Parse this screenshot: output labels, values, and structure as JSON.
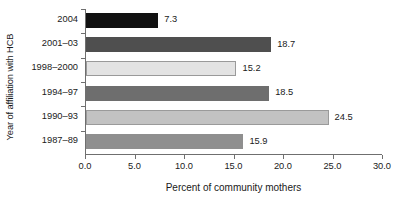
{
  "chart_data": {
    "type": "bar",
    "orientation": "horizontal",
    "title": "",
    "xlabel": "Percent of community mothers",
    "ylabel": "Year of affiliation with HCB",
    "categories": [
      "2004",
      "2001–03",
      "1998–2000",
      "1994–97",
      "1990–93",
      "1987–89"
    ],
    "values": [
      7.3,
      18.7,
      15.2,
      18.5,
      24.5,
      15.9
    ],
    "value_labels": [
      "7.3",
      "18.7",
      "15.2",
      "18.5",
      "24.5",
      "15.9"
    ],
    "bar_colors": [
      "#111111",
      "#4f4f4f",
      "#e3e3e3",
      "#6e6e6e",
      "#c2c2c2",
      "#8f8f8f"
    ],
    "bar_border_colors": [
      "#111111",
      "#4f4f4f",
      "#9a9a9a",
      "#6e6e6e",
      "#9a9a9a",
      "#8f8f8f"
    ],
    "xlim": [
      0.0,
      30.0
    ],
    "xticks": [
      0.0,
      5.0,
      10.0,
      15.0,
      20.0,
      25.0,
      30.0
    ],
    "xtick_labels": [
      "0.0",
      "5.0",
      "10.0",
      "15.0",
      "20.0",
      "25.0",
      "30.0"
    ],
    "grid": false,
    "legend": "none",
    "axis_color": "#6f6f6f"
  }
}
